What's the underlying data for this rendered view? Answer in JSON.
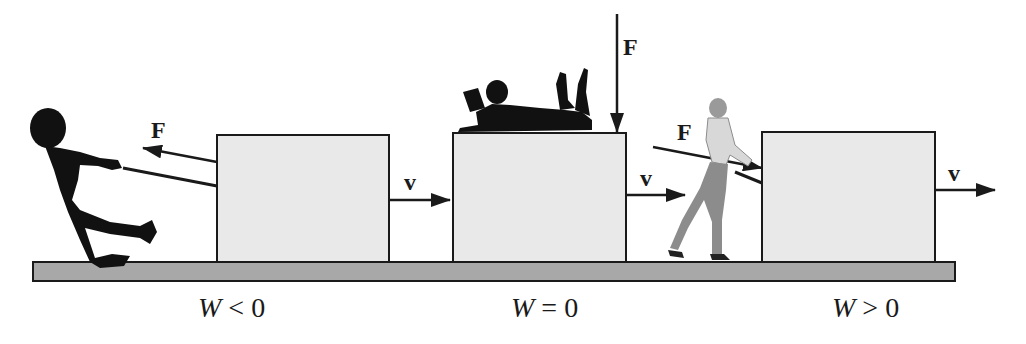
{
  "diagram": {
    "colors": {
      "box_fill": "#e9e9e9",
      "floor_fill": "#a8a8a8",
      "outline": "#1a1a1a",
      "silhouette": "#111111",
      "pusher": "#8c8c8c"
    },
    "panels": [
      {
        "force_label": "F",
        "velocity_label": "v",
        "scenario": "person pulls backward on rope while box moves right",
        "caption_var": "W",
        "caption_op": "<",
        "caption_val": "0"
      },
      {
        "force_label": "F",
        "velocity_label": "v",
        "scenario": "person lying on top of box, force straight down",
        "caption_var": "W",
        "caption_op": "=",
        "caption_val": "0"
      },
      {
        "force_label": "F",
        "velocity_label": "v",
        "scenario": "person pushes box forward with a stick",
        "caption_var": "W",
        "caption_op": ">",
        "caption_val": "0"
      }
    ]
  }
}
